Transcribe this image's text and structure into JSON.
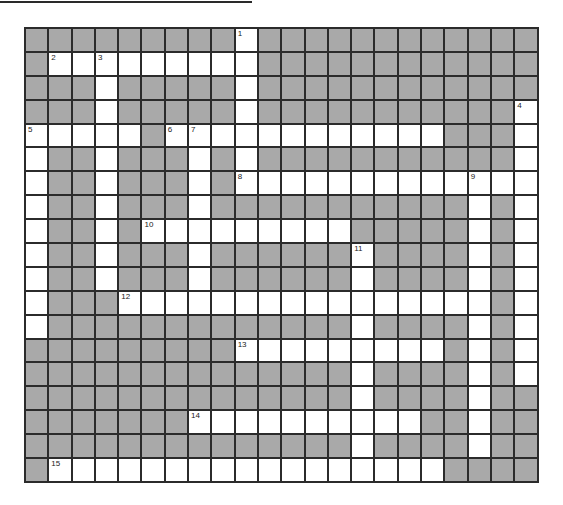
{
  "puzzle": {
    "cols": 22,
    "rows": 19,
    "colors": {
      "block": "#a9a9a9",
      "open": "#ffffff",
      "line": "#2b2b2b"
    },
    "open_cells": {
      "0": [
        9
      ],
      "1": [
        1,
        2,
        3,
        4,
        5,
        6,
        7,
        8,
        9
      ],
      "2": [
        3,
        9
      ],
      "3": [
        3,
        9,
        21
      ],
      "4": [
        0,
        1,
        2,
        3,
        4,
        6,
        7,
        8,
        9,
        10,
        11,
        12,
        13,
        14,
        15,
        16,
        17,
        21
      ],
      "5": [
        0,
        3,
        7,
        9,
        21
      ],
      "6": [
        0,
        3,
        7,
        9,
        10,
        11,
        12,
        13,
        14,
        15,
        16,
        17,
        18,
        19,
        20,
        21
      ],
      "7": [
        0,
        3,
        7,
        19,
        21
      ],
      "8": [
        0,
        3,
        5,
        6,
        7,
        8,
        9,
        10,
        11,
        12,
        13,
        19,
        21
      ],
      "9": [
        0,
        3,
        7,
        14,
        19,
        21
      ],
      "10": [
        0,
        3,
        7,
        14,
        19,
        21
      ],
      "11": [
        0,
        4,
        5,
        6,
        7,
        8,
        9,
        10,
        11,
        12,
        13,
        14,
        15,
        16,
        17,
        18,
        19,
        21
      ],
      "12": [
        0,
        14,
        19,
        21
      ],
      "13": [
        9,
        10,
        11,
        12,
        13,
        14,
        15,
        16,
        17,
        19,
        21
      ],
      "14": [
        14,
        19,
        21
      ],
      "15": [
        14,
        19
      ],
      "16": [
        7,
        8,
        9,
        10,
        11,
        12,
        13,
        14,
        15,
        16,
        19
      ],
      "17": [
        14,
        19
      ],
      "18": [
        1,
        2,
        3,
        4,
        5,
        6,
        7,
        8,
        9,
        10,
        11,
        12,
        13,
        14,
        15,
        16,
        17
      ]
    },
    "clue_numbers": [
      {
        "n": "1",
        "r": 0,
        "c": 9
      },
      {
        "n": "2",
        "r": 1,
        "c": 1
      },
      {
        "n": "3",
        "r": 1,
        "c": 3
      },
      {
        "n": "4",
        "r": 3,
        "c": 21
      },
      {
        "n": "5",
        "r": 4,
        "c": 0
      },
      {
        "n": "6",
        "r": 4,
        "c": 6
      },
      {
        "n": "7",
        "r": 4,
        "c": 7
      },
      {
        "n": "8",
        "r": 6,
        "c": 9
      },
      {
        "n": "9",
        "r": 6,
        "c": 19
      },
      {
        "n": "10",
        "r": 8,
        "c": 5
      },
      {
        "n": "11",
        "r": 9,
        "c": 14
      },
      {
        "n": "12",
        "r": 11,
        "c": 4
      },
      {
        "n": "13",
        "r": 13,
        "c": 9
      },
      {
        "n": "14",
        "r": 16,
        "c": 7
      },
      {
        "n": "15",
        "r": 18,
        "c": 1
      }
    ]
  }
}
